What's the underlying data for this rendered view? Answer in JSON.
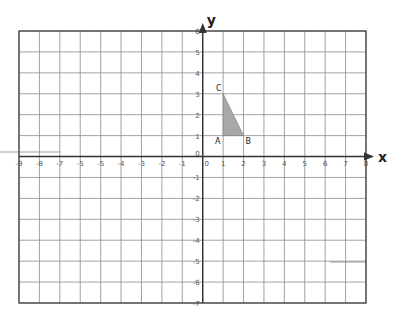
{
  "axes": {
    "x_label": "x",
    "y_label": "y",
    "x_range": [
      -9,
      8
    ],
    "y_range": [
      -7,
      6
    ],
    "x_tick_labels": [
      "-9",
      "-8",
      "-7",
      "-5",
      "-5",
      "-4",
      "-3",
      "-2",
      "-1",
      "0",
      "1",
      "2",
      "3",
      "4",
      "5",
      "6",
      "7",
      "8"
    ],
    "y_tick_labels": [
      "6",
      "5",
      "4",
      "3",
      "2",
      "1",
      "0",
      "-1",
      "-2",
      "-3",
      "-4",
      "-5",
      "-6",
      "-7"
    ]
  },
  "colors": {
    "grid": "#8a8a8a",
    "border": "#444444",
    "axis": "#333333",
    "triangle_fill": "#a8a8a8",
    "faint_line": "#cfcfcf"
  },
  "chart_data": {
    "type": "scatter",
    "title": "",
    "xlabel": "x",
    "ylabel": "y",
    "xlim": [
      -9,
      8
    ],
    "ylim": [
      -7,
      6
    ],
    "grid": true,
    "shapes": [
      {
        "name": "triangle ABC",
        "kind": "polygon",
        "filled": true,
        "vertices": [
          {
            "label": "A",
            "x": 1,
            "y": 1
          },
          {
            "label": "B",
            "x": 2,
            "y": 1
          },
          {
            "label": "C",
            "x": 1,
            "y": 3
          }
        ]
      }
    ]
  }
}
